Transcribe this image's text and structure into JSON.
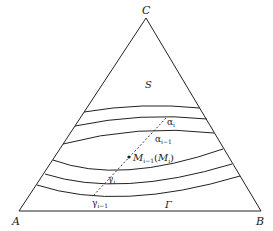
{
  "figure": {
    "vertices": {
      "A": {
        "label": "A",
        "x": 19,
        "y": 211
      },
      "B": {
        "label": "B",
        "x": 261,
        "y": 211
      },
      "C": {
        "label": "C",
        "x": 146,
        "y": 18
      }
    },
    "region_labels": {
      "S": "S",
      "Gamma": "Γ"
    },
    "curve_labels": {
      "alpha_i": {
        "base": "α",
        "sub": "i"
      },
      "alpha_i_minus_1": {
        "base": "α",
        "sub": "i−1"
      },
      "gamma_i": {
        "base": "γ",
        "sub": "i"
      },
      "gamma_i_minus_1": {
        "base": "γ",
        "sub": "i−1"
      }
    },
    "point_label": {
      "base": "M",
      "sub": "i−1",
      "paren_open": "(",
      "base2": "M",
      "sub2": "i",
      "paren_close": ")"
    },
    "colors": {
      "stroke": "#222222",
      "background": "#ffffff"
    }
  }
}
